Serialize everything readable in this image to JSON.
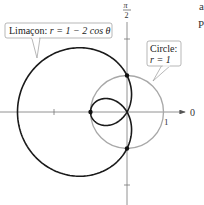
{
  "figure": {
    "type": "polar-graph",
    "axis_labels": {
      "polar_axis": "0",
      "vertical_top_num": "π",
      "vertical_top_den": "2",
      "unit_tick": "1"
    },
    "curves": [
      {
        "name": "limacon",
        "label_prefix": "Limaçon: ",
        "label_eq": "r = 1 − 2 cos θ",
        "equation": "r = 1 - 2cos(theta)",
        "a": 1,
        "b": -2,
        "color": "#1a1a1a"
      },
      {
        "name": "circle",
        "label_line1": "Circle:",
        "label_line2": "r = 1",
        "equation": "r = 1",
        "radius": 1,
        "color": "#a8a8a8"
      }
    ],
    "intersection_points": [
      {
        "label": "(1, π/2)",
        "x": 0,
        "y": 1
      },
      {
        "label": "(1, 3π/2)",
        "x": 0,
        "y": -1
      },
      {
        "label": "inner loop vertex",
        "x": -1,
        "y": 0
      }
    ],
    "ticks_x": [
      -2,
      1
    ],
    "ticks_y": [
      2,
      1,
      -2
    ],
    "origin_px": [
      127,
      112
    ],
    "scale_px_per_unit": 36.5
  },
  "edge_fragments": [
    "a",
    "P"
  ]
}
